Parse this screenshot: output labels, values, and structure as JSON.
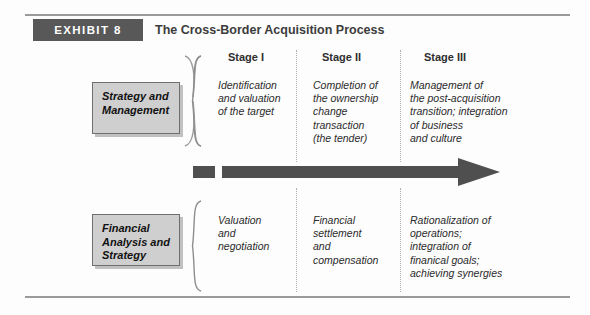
{
  "header": {
    "tag": "EXHIBIT 8",
    "title": "The Cross-Border Acquisition Process"
  },
  "colors": {
    "tag_background": "#585858",
    "tag_text": "#ffffff",
    "label_box_background": "#cfcfcf",
    "label_box_border": "#6f6f6f",
    "arrow": "#4f4f4f",
    "rule": "#9a9a9a",
    "divider": "#aeaeae",
    "body_text": "#2b2b2b"
  },
  "stages": [
    {
      "label": "Stage I"
    },
    {
      "label": "Stage II"
    },
    {
      "label": "Stage III"
    }
  ],
  "rows": [
    {
      "label": "Strategy\nand\nManagement",
      "cells": [
        "Identification\nand valuation\nof the target",
        "Completion of\nthe ownership\nchange\ntransaction\n(the tender)",
        "Management of\nthe post-acquisition\ntransition; integration\nof business\nand culture"
      ]
    },
    {
      "label": "Financial\nAnalysis\nand Strategy",
      "cells": [
        "Valuation\nand\nnegotiation",
        "Financial\nsettlement\nand\ncompensation",
        "Rationalization of\noperations;\nintegration of\nfinanical goals;\nachieving synergies"
      ]
    }
  ]
}
